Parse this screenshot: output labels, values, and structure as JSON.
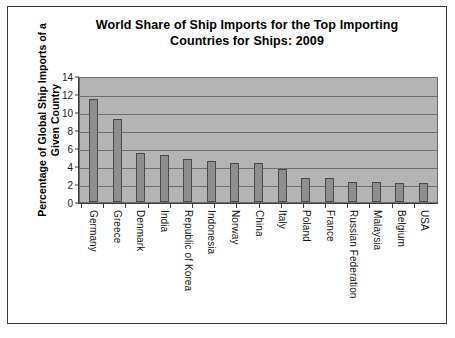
{
  "chart_data": {
    "type": "bar",
    "title": "World Share of Ship Imports for the Top Importing Countries for Ships: 2009",
    "title_line1": "World Share of Ship Imports for the Top Importing",
    "title_line2": "Countries for Ships: 2009",
    "xlabel": "",
    "ylabel": "Percentage of Global Ship Imports of a Given Country",
    "ylabel_line1": "Percentage of Global Ship Imports of a",
    "ylabel_line2": "Given Country",
    "ylim": [
      0,
      14
    ],
    "ytick_values": [
      0,
      2,
      4,
      6,
      8,
      10,
      12,
      14
    ],
    "ytick_labels": [
      "0",
      "2",
      "4",
      "6",
      "8",
      "10",
      "12",
      "14"
    ],
    "grid": true,
    "grid_axis": "y",
    "legend": false,
    "categories": [
      "Germany",
      "Greece",
      "Denmark",
      "India",
      "Republic of Korea",
      "Indonesia",
      "Norway",
      "China",
      "Italy",
      "Poland",
      "France",
      "Russian Federation",
      "Malaysia",
      "Belgium",
      "USA"
    ],
    "values": [
      11.5,
      9.2,
      5.5,
      5.2,
      4.8,
      4.6,
      4.3,
      4.3,
      3.7,
      2.7,
      2.7,
      2.2,
      2.2,
      2.1,
      2.1
    ],
    "colors": {
      "bar_fill": "#8e8e8e",
      "bar_edge": "#4a4a4a",
      "plot_background": "#b4b4b4",
      "gridline": "#6f6f6f",
      "axis": "#3c3c3c",
      "text": "#000000",
      "frame": "#3a3a3a",
      "canvas": "#ffffff"
    }
  }
}
